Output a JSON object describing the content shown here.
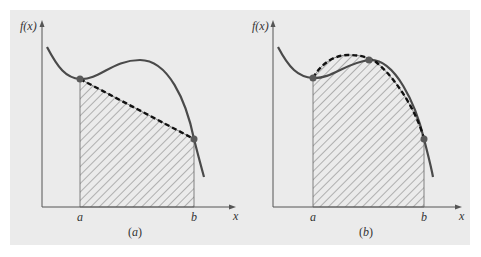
{
  "figure": {
    "background_color": "#ebebeb",
    "curve_color": "#4a4a4a",
    "panels": [
      {
        "id": "a",
        "caption_open": "(",
        "caption_letter": "a",
        "caption_close": ")",
        "y_axis_label": "f(x)",
        "x_axis_label": "x",
        "lower_limit_label": "a",
        "upper_limit_label": "b",
        "description": "Trapezoidal rule: straight dashed line connecting f(a) and f(b), shaded area under line"
      },
      {
        "id": "b",
        "caption_open": "(",
        "caption_letter": "b",
        "caption_close": ")",
        "y_axis_label": "f(x)",
        "x_axis_label": "x",
        "lower_limit_label": "a",
        "upper_limit_label": "b",
        "description": "Simpson's rule: dashed parabola through three points, shaded area under parabola"
      }
    ]
  }
}
